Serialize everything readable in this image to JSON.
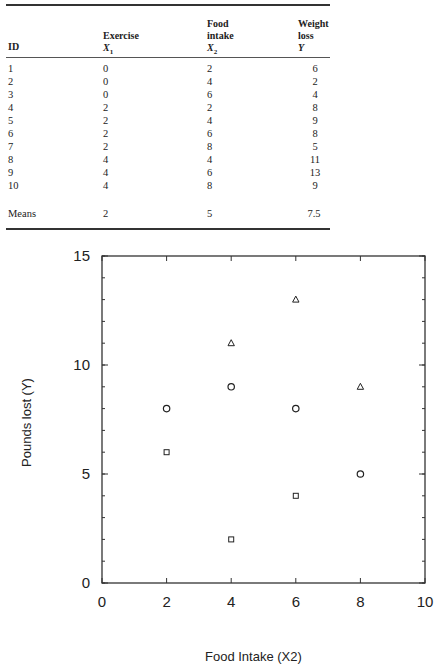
{
  "table": {
    "headers": {
      "id": "ID",
      "x1_line1": "Exercise",
      "x1_line2": "X",
      "x1_sub": "1",
      "x2_line1": "Food",
      "x2_line2": "intake",
      "x2_line3": "X",
      "x2_sub": "2",
      "y_line1": "Weight",
      "y_line2": "loss",
      "y_line3": "Y"
    },
    "rows": [
      {
        "id": "1",
        "x1": "0",
        "x2": "2",
        "y": "6"
      },
      {
        "id": "2",
        "x1": "0",
        "x2": "4",
        "y": "2"
      },
      {
        "id": "3",
        "x1": "0",
        "x2": "6",
        "y": "4"
      },
      {
        "id": "4",
        "x1": "2",
        "x2": "2",
        "y": "8"
      },
      {
        "id": "5",
        "x1": "2",
        "x2": "4",
        "y": "9"
      },
      {
        "id": "6",
        "x1": "2",
        "x2": "6",
        "y": "8"
      },
      {
        "id": "7",
        "x1": "2",
        "x2": "8",
        "y": "5"
      },
      {
        "id": "8",
        "x1": "4",
        "x2": "4",
        "y": "11"
      },
      {
        "id": "9",
        "x1": "4",
        "x2": "6",
        "y": "13"
      },
      {
        "id": "10",
        "x1": "4",
        "x2": "8",
        "y": "9"
      }
    ],
    "means": {
      "label": "Means",
      "x1": "2",
      "x2": "5",
      "y": "7.5"
    }
  },
  "chart_data": {
    "type": "scatter",
    "title": "",
    "xlabel": "Food Intake (X2)",
    "ylabel": "Pounds lost (Y)",
    "xlim": [
      0,
      10
    ],
    "ylim": [
      0,
      15
    ],
    "x_ticks": [
      "0",
      "2",
      "4",
      "6",
      "8",
      "10"
    ],
    "y_ticks": [
      "0",
      "5",
      "10",
      "15"
    ],
    "grid": false,
    "legend": null,
    "series": [
      {
        "name": "Exercise X1 = 0",
        "marker": "square",
        "points": [
          [
            2,
            6
          ],
          [
            4,
            2
          ],
          [
            6,
            4
          ]
        ]
      },
      {
        "name": "Exercise X1 = 2",
        "marker": "circle",
        "points": [
          [
            2,
            8
          ],
          [
            4,
            9
          ],
          [
            6,
            8
          ],
          [
            8,
            5
          ]
        ]
      },
      {
        "name": "Exercise X1 = 4",
        "marker": "triangle",
        "points": [
          [
            4,
            11
          ],
          [
            6,
            13
          ],
          [
            8,
            9
          ]
        ]
      }
    ]
  }
}
